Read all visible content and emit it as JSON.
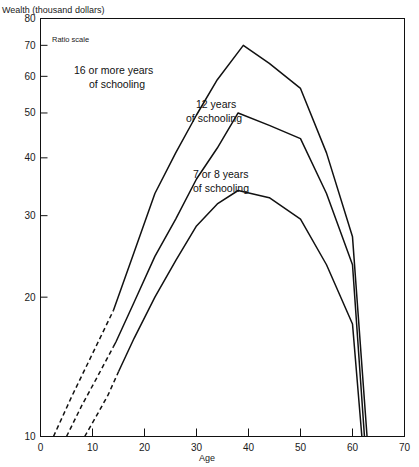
{
  "chart_data": {
    "type": "line",
    "title": "Wealth (thousand dollars)",
    "subtitle": "Ratio scale",
    "xlabel": "Age",
    "ylabel": "Wealth (thousand dollars)",
    "scale_note": "Ratio scale",
    "yscale": "log",
    "ylim": [
      10,
      80
    ],
    "xlim": [
      0,
      70
    ],
    "grid": false,
    "legend_position": "inline-annotations",
    "yticks": [
      10,
      20,
      30,
      40,
      50,
      60,
      70,
      80
    ],
    "yticklabels": [
      "10",
      "20",
      "30",
      "40",
      "50",
      "60",
      "70",
      "80"
    ],
    "xticks": [
      0,
      10,
      20,
      30,
      40,
      50,
      60,
      70
    ],
    "xticklabels": [
      "0",
      "10",
      "20",
      "30",
      "40",
      "50",
      "60",
      "70"
    ],
    "series": [
      {
        "name": "16 or more years of schooling",
        "label": "16 or more years",
        "label2": "of schooling",
        "dashed_until_age": 14,
        "x": [
          2.5,
          6,
          10,
          14,
          18,
          22,
          26,
          30,
          34,
          39,
          44,
          50,
          55,
          60,
          62.8
        ],
        "y": [
          10,
          12.2,
          15.1,
          18.7,
          25.0,
          33.5,
          41.0,
          49.5,
          59.0,
          70.0,
          64.0,
          56.5,
          41.0,
          27.0,
          10.0
        ]
      },
      {
        "name": "12 years of schooling",
        "label": "12 years",
        "label2": "of schooling",
        "dashed_until_age": 14,
        "x": [
          5,
          8,
          11,
          14.5,
          18,
          22,
          26,
          30,
          34,
          38,
          44,
          50,
          55,
          60,
          62.3
        ],
        "y": [
          10,
          11.7,
          13.5,
          16.0,
          19.5,
          24.5,
          29.5,
          36.0,
          42.0,
          50.0,
          47.0,
          44.0,
          33.5,
          23.5,
          10.0
        ]
      },
      {
        "name": "7 or 8 years of schooling",
        "label": "7 or 8 years",
        "label2": "of schooling",
        "dashed_until_age": 15,
        "x": [
          8.5,
          11,
          13,
          15,
          18,
          22,
          26,
          30,
          34,
          38,
          44,
          50,
          55,
          60,
          61.8
        ],
        "y": [
          10,
          11.2,
          12.3,
          13.8,
          16.3,
          20.0,
          24.0,
          28.5,
          31.8,
          34.0,
          32.8,
          29.5,
          23.5,
          17.5,
          10.0
        ]
      }
    ],
    "annotations": [
      {
        "text": "16 or more years",
        "x_px": 74,
        "y_px": 74
      },
      {
        "text": "of schooling",
        "x_px": 89,
        "y_px": 88
      },
      {
        "text": "12 years",
        "x_px": 196,
        "y_px": 108
      },
      {
        "text": "of schooling",
        "x_px": 186,
        "y_px": 122
      },
      {
        "text": "7 or 8 years",
        "x_px": 193,
        "y_px": 178
      },
      {
        "text": "of schooling",
        "x_px": 193,
        "y_px": 192
      }
    ]
  }
}
